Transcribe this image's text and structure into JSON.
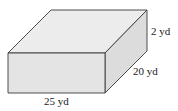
{
  "figure": {
    "type": "rectangular-prism",
    "colors": {
      "top_face": "#ececec",
      "front_face": "#e4e4e4",
      "side_face": "#dcdcdc",
      "edge": "#3a3a3a",
      "text": "#222222"
    },
    "dimensions": {
      "height": {
        "value": 2,
        "unit": "yd",
        "label": "2 yd"
      },
      "depth": {
        "value": 20,
        "unit": "yd",
        "label": "20 yd"
      },
      "length": {
        "value": 25,
        "unit": "yd",
        "label": "25 yd"
      }
    }
  }
}
